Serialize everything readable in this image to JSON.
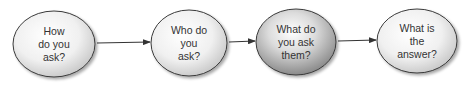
{
  "diagram": {
    "type": "flow",
    "nodes": [
      {
        "id": "n1",
        "lines": [
          "How",
          "do you",
          "ask?"
        ],
        "style": "light"
      },
      {
        "id": "n2",
        "lines": [
          "Who do",
          "you",
          "ask?"
        ],
        "style": "light"
      },
      {
        "id": "n3",
        "lines": [
          "What do",
          "you ask",
          "them?"
        ],
        "style": "dark"
      },
      {
        "id": "n4",
        "lines": [
          "What is",
          "the",
          "answer?"
        ],
        "style": "light"
      }
    ],
    "edges": [
      {
        "from": "n1",
        "to": "n2"
      },
      {
        "from": "n2",
        "to": "n3"
      },
      {
        "from": "n3",
        "to": "n4"
      }
    ],
    "colors": {
      "stroke": "#3a3a3a",
      "arrow": "#333333",
      "text": "#333333"
    }
  }
}
